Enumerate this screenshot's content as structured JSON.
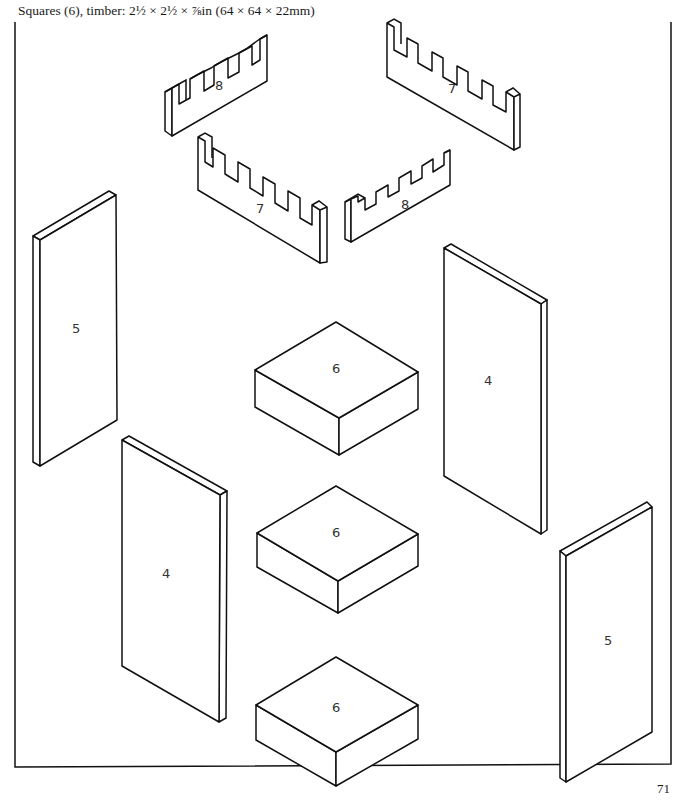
{
  "caption": "Squares (6), timber: 2½ × 2½ × ⅞in (64 × 64 × 22mm)",
  "page_number": "71",
  "parts": {
    "notched_8_top": "8",
    "notched_7_top": "7",
    "notched_7_mid": "7",
    "notched_8_mid": "8",
    "panel_5_left": "5",
    "panel_4_right": "4",
    "panel_4_left": "4",
    "panel_5_right": "5",
    "square_1": "6",
    "square_2": "6",
    "square_3": "6"
  }
}
